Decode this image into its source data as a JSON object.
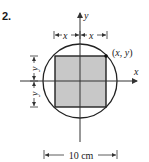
{
  "problem": {
    "number": "2."
  },
  "axes": {
    "x_label": "x",
    "y_label": "y"
  },
  "point": {
    "label": "(x, y)"
  },
  "dimensions": {
    "top_left_label": "x",
    "top_right_label": "x",
    "left_top_label": "y",
    "left_bottom_label": "y",
    "bottom_label": "10 cm"
  },
  "shapes": {
    "circle": {
      "diameter": "10 cm",
      "stroke": "#222222"
    },
    "square": {
      "fill": "#c8c8c8",
      "stroke": "#222222"
    }
  }
}
